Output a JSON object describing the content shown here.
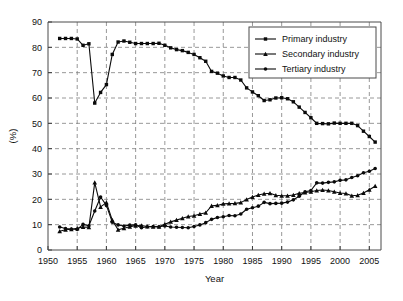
{
  "chart_data": {
    "type": "line",
    "title": "",
    "xlabel": "Year",
    "ylabel": "(%)",
    "xlim": [
      1950,
      2007
    ],
    "ylim": [
      0,
      90
    ],
    "grid": true,
    "legend_position": "top-right",
    "x_ticks": [
      1950,
      1955,
      1960,
      1965,
      1970,
      1975,
      1980,
      1985,
      1990,
      1995,
      2000,
      2005
    ],
    "y_ticks": [
      0,
      10,
      20,
      30,
      40,
      50,
      60,
      70,
      80,
      90
    ],
    "x": [
      1952,
      1953,
      1954,
      1955,
      1956,
      1957,
      1958,
      1959,
      1960,
      1961,
      1962,
      1963,
      1964,
      1965,
      1966,
      1967,
      1968,
      1969,
      1970,
      1971,
      1972,
      1973,
      1974,
      1975,
      1976,
      1977,
      1978,
      1979,
      1980,
      1981,
      1982,
      1983,
      1984,
      1985,
      1986,
      1987,
      1988,
      1989,
      1990,
      1991,
      1992,
      1993,
      1994,
      1995,
      1996,
      1997,
      1998,
      1999,
      2000,
      2001,
      2002,
      2003,
      2004,
      2005,
      2006
    ],
    "series": [
      {
        "name": "Primary industry",
        "marker": "square",
        "values": [
          83.5,
          83.5,
          83.5,
          83.3,
          80.8,
          81.4,
          58.0,
          62.2,
          65.3,
          77.2,
          82.1,
          82.5,
          82.0,
          81.5,
          81.5,
          81.5,
          81.5,
          81.6,
          80.8,
          79.8,
          79.1,
          78.7,
          78.0,
          77.2,
          75.9,
          74.5,
          70.5,
          69.8,
          68.7,
          68.1,
          68.1,
          67.1,
          64.0,
          62.4,
          60.9,
          59.0,
          59.3,
          60.0,
          60.1,
          59.7,
          58.5,
          56.4,
          54.3,
          52.2,
          50.0,
          49.9,
          49.8,
          50.1,
          50.0,
          50.0,
          50.0,
          49.1,
          46.9,
          44.8,
          42.6
        ]
      },
      {
        "name": "Secondary industry",
        "marker": "triangle",
        "values": [
          7.4,
          8.0,
          8.2,
          8.6,
          9.1,
          9.0,
          26.6,
          17.0,
          18.7,
          11.8,
          8.0,
          8.6,
          9.2,
          9.6,
          9.7,
          9.3,
          9.2,
          9.2,
          10.2,
          11.1,
          11.8,
          12.5,
          13.2,
          13.5,
          14.2,
          14.7,
          17.4,
          17.6,
          18.2,
          18.3,
          18.4,
          18.7,
          19.9,
          20.9,
          21.7,
          22.2,
          22.4,
          21.6,
          21.4,
          21.4,
          21.7,
          22.4,
          22.7,
          23.0,
          23.5,
          23.7,
          23.5,
          23.0,
          22.5,
          22.3,
          21.4,
          21.6,
          22.5,
          23.8,
          25.2
        ]
      },
      {
        "name": "Tertiary industry",
        "marker": "circle",
        "values": [
          9.1,
          8.5,
          8.3,
          8.1,
          10.1,
          9.6,
          15.4,
          20.9,
          17.6,
          11.0,
          9.9,
          9.5,
          9.8,
          9.9,
          8.8,
          9.2,
          9.3,
          9.2,
          9.5,
          9.1,
          9.0,
          8.9,
          8.8,
          9.3,
          9.9,
          10.8,
          12.1,
          12.8,
          13.1,
          13.6,
          13.5,
          14.2,
          16.1,
          16.7,
          17.3,
          18.8,
          18.3,
          18.4,
          18.5,
          18.9,
          19.8,
          21.2,
          23.0,
          23.5,
          26.5,
          26.4,
          26.7,
          26.9,
          27.5,
          27.7,
          28.6,
          29.3,
          30.5,
          31.1,
          32.2
        ]
      }
    ]
  }
}
